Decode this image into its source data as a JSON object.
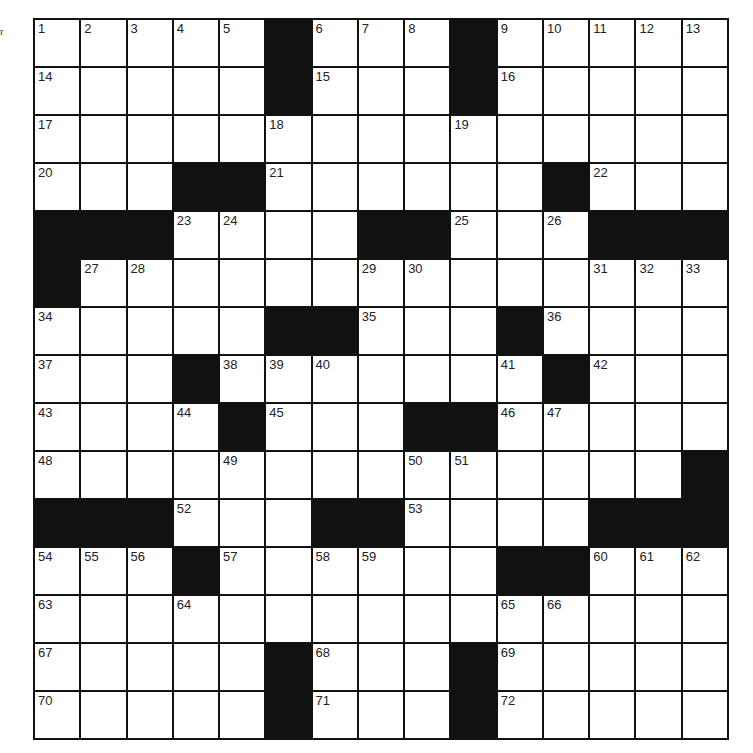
{
  "puzzle": {
    "side_mark": "r",
    "rows": 15,
    "cols": 15,
    "colors": {
      "black_square": "#111111",
      "white_square": "#ffffff",
      "grid_line": "#111111"
    },
    "grid": [
      [
        "1",
        "2",
        "3",
        "4",
        "5",
        "#",
        "6",
        "7",
        "8",
        "#",
        "9",
        "10",
        "11",
        "12",
        "13"
      ],
      [
        "14",
        "",
        "",
        "",
        "",
        "#",
        "15",
        "",
        "",
        "#",
        "16",
        "",
        "",
        "",
        ""
      ],
      [
        "17",
        "",
        "",
        "",
        "",
        "18",
        "",
        "",
        "",
        "19",
        "",
        "",
        "",
        "",
        ""
      ],
      [
        "20",
        "",
        "",
        "#",
        "#",
        "21",
        "",
        "",
        "",
        "",
        "",
        "#",
        "22",
        "",
        ""
      ],
      [
        "#",
        "#",
        "#",
        "23",
        "24",
        "",
        "",
        "#",
        "#",
        "25",
        "",
        "26",
        "#",
        "#",
        "#"
      ],
      [
        "#",
        "27",
        "28",
        "",
        "",
        "",
        "",
        "29",
        "30",
        "",
        "",
        "",
        "31",
        "32",
        "33"
      ],
      [
        "34",
        "",
        "",
        "",
        "",
        "#",
        "#",
        "35",
        "",
        "",
        "#",
        "36",
        "",
        "",
        ""
      ],
      [
        "37",
        "",
        "",
        "#",
        "38",
        "39",
        "40",
        "",
        "",
        "",
        "41",
        "#",
        "42",
        "",
        ""
      ],
      [
        "43",
        "",
        "",
        "44",
        "#",
        "45",
        "",
        "",
        "#",
        "#",
        "46",
        "47",
        "",
        "",
        ""
      ],
      [
        "48",
        "",
        "",
        "",
        "49",
        "",
        "",
        "",
        "50",
        "51",
        "",
        "",
        "",
        "",
        "#"
      ],
      [
        "#",
        "#",
        "#",
        "52",
        "",
        "",
        "#",
        "#",
        "53",
        "",
        "",
        "",
        "#",
        "#",
        "#"
      ],
      [
        "54",
        "55",
        "56",
        "#",
        "57",
        "",
        "58",
        "59",
        "",
        "",
        "#",
        "#",
        "60",
        "61",
        "62"
      ],
      [
        "63",
        "",
        "",
        "64",
        "",
        "",
        "",
        "",
        "",
        "",
        "65",
        "66",
        "",
        "",
        ""
      ],
      [
        "67",
        "",
        "",
        "",
        "",
        "#",
        "68",
        "",
        "",
        "#",
        "69",
        "",
        "",
        "",
        ""
      ],
      [
        "70",
        "",
        "",
        "",
        "",
        "#",
        "71",
        "",
        "",
        "#",
        "72",
        "",
        "",
        "",
        ""
      ]
    ]
  }
}
